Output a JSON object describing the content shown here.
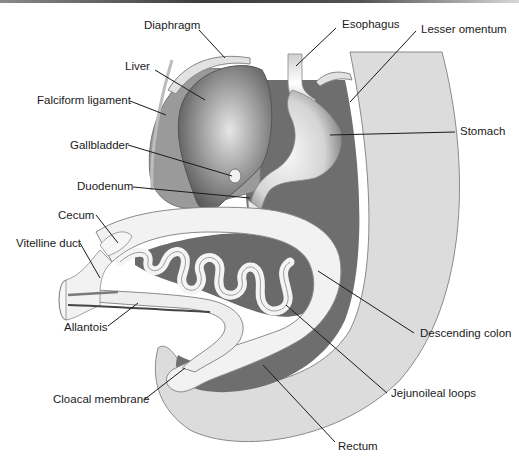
{
  "figure": {
    "labels": {
      "diaphragm": "Diaphragm",
      "esophagus": "Esophagus",
      "lesser_omentum": "Lesser omentum",
      "liver": "Liver",
      "falciform_ligament": "Falciform ligament",
      "stomach": "Stomach",
      "gallbladder": "Gallbladder",
      "duodenum": "Duodenum",
      "cecum": "Cecum",
      "vitelline_duct": "Vitelline duct",
      "allantois": "Allantois",
      "descending_colon": "Descending colon",
      "cloacal_membrane": "Cloacal membrane",
      "jejunoileal_loops": "Jejunoileal loops",
      "rectum": "Rectum"
    },
    "colors": {
      "body_wall": "#dcdcdc",
      "mesentery": "#6e6e6e",
      "gut_tube": "#f4f4f4",
      "liver": "#8c8c8c",
      "outline": "#777777",
      "text": "#1a1a1a"
    }
  }
}
